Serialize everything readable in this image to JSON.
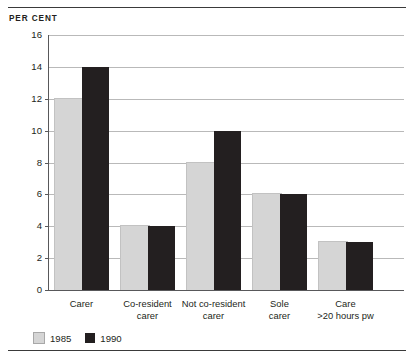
{
  "chart_data": {
    "type": "bar",
    "title": "",
    "axis_unit_label": "PER CENT",
    "xlabel": "",
    "ylabel": "PER CENT",
    "ylim": [
      0,
      16
    ],
    "ytick_step": 2,
    "grid": true,
    "legend_position": "bottom-left",
    "categories": [
      "Carer",
      "Co-resident carer",
      "Not co-resident carer",
      "Sole carer",
      "Care >20 hours pw"
    ],
    "category_lines": [
      [
        "Carer"
      ],
      [
        "Co-resident",
        "carer"
      ],
      [
        "Not co-resident",
        "carer"
      ],
      [
        "Sole",
        "carer"
      ],
      [
        "Care",
        ">20 hours pw"
      ]
    ],
    "ytick_labels": [
      "0",
      "2",
      "4",
      "6",
      "8",
      "10",
      "12",
      "14",
      "16"
    ],
    "ytick_values": [
      0,
      2,
      4,
      6,
      8,
      10,
      12,
      14,
      16
    ],
    "series": [
      {
        "name": "1985",
        "color": "#d5d5d5",
        "values": [
          12,
          4,
          8,
          6,
          3
        ]
      },
      {
        "name": "1990",
        "color": "#231f20",
        "values": [
          14,
          4,
          10,
          6,
          3
        ]
      }
    ]
  },
  "legend": {
    "items": [
      {
        "label": "1985",
        "swatch": "legend-swatch-1985"
      },
      {
        "label": "1990",
        "swatch": "legend-swatch-1990"
      }
    ]
  }
}
